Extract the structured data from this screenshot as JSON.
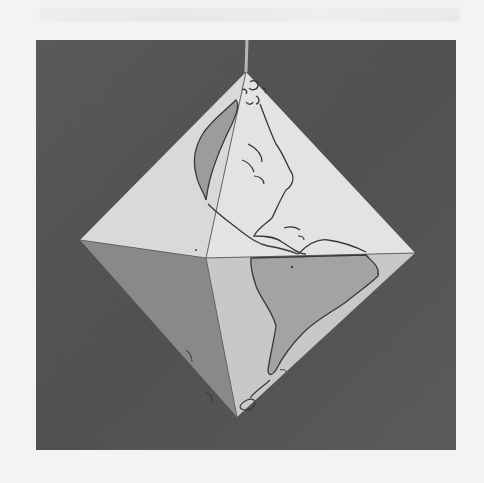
{
  "image": {
    "subject": "paper octahedron world globe hanging on a string",
    "background_description": "dark gray textured backdrop",
    "continents_visible": [
      "North America",
      "Central America",
      "South America",
      "Greenland"
    ],
    "colors": {
      "page": "#f3f3f3",
      "backdrop": "#5a5a5a",
      "face_light": "#e2e2e2",
      "face_lighter": "#ececec",
      "face_mid": "#b9b9b9",
      "face_shadow": "#8f8f8f",
      "land": "#a8a8a8",
      "outline": "#3a3a3a"
    }
  }
}
